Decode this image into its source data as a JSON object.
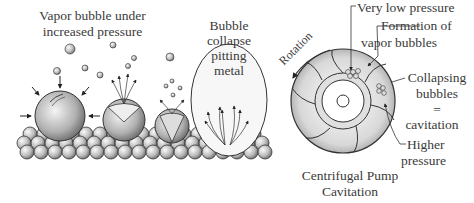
{
  "left_panel": {
    "title_line1": "Vapor bubble under",
    "title_line2": "increased pressure",
    "collapse_line1": "Bubble",
    "collapse_line2": "collapse",
    "collapse_line3": "pitting",
    "collapse_line4": "metal"
  },
  "right_panel": {
    "rotation": "Rotation",
    "very_low_pressure": "Very low pressure",
    "formation_line1": "Formation of",
    "formation_line2": "vapor bubbles",
    "collapsing_line1": "Collapsing",
    "collapsing_line2": "bubbles",
    "equals": "=",
    "cavitation": "cavitation",
    "higher_line1": "Higher",
    "higher_line2": "pressure",
    "caption_line1": "Centrifugal Pump",
    "caption_line2": "Cavitation"
  }
}
